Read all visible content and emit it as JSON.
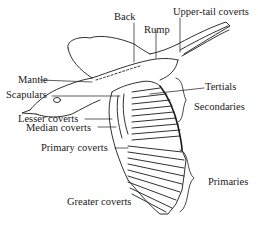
{
  "diagram": {
    "labels": {
      "back": "Back",
      "rump": "Rump",
      "upper_tail_coverts": "Upper-tail coverts",
      "mantle": "Mantle",
      "scapulars": "Scapulars",
      "tertials": "Tertials",
      "secondaries": "Secondaries",
      "lesser_coverts": "Lesser coverts",
      "median_coverts": "Median coverts",
      "primary_coverts": "Primary coverts",
      "primaries": "Primaries",
      "greater_coverts": "Greater coverts"
    },
    "colors": {
      "ink": "#1a1a1a",
      "background": "#ffffff"
    }
  }
}
